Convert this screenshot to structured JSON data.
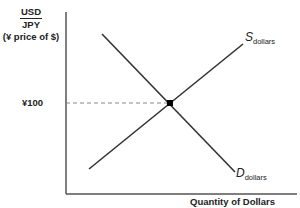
{
  "diagram": {
    "y_axis": {
      "numerator": "USD",
      "denominator": "JPY",
      "subtitle": "(¥ price of $)",
      "tick_label": "¥100"
    },
    "x_axis": {
      "label": "Quantity of Dollars"
    },
    "curves": {
      "supply": {
        "letter": "S",
        "subscript": "dollars"
      },
      "demand": {
        "letter": "D",
        "subscript": "dollars"
      }
    },
    "equilibrium": {
      "price": "¥100"
    },
    "colors": {
      "line": "#222222",
      "dashed": "#888888"
    }
  }
}
